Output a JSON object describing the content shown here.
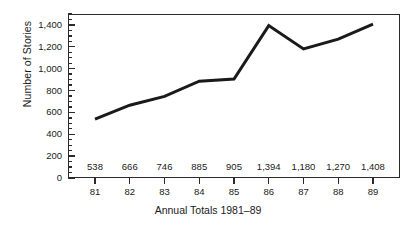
{
  "chart_data": {
    "type": "line",
    "title": "",
    "xlabel": "Annual Totals 1981–89",
    "ylabel": "Number of Stories",
    "categories": [
      "81",
      "82",
      "83",
      "84",
      "85",
      "86",
      "87",
      "88",
      "89"
    ],
    "values": [
      538,
      666,
      746,
      885,
      905,
      1394,
      1180,
      1270,
      1408
    ],
    "value_labels": [
      "538",
      "666",
      "746",
      "885",
      "905",
      "1,394",
      "1,180",
      "1,270",
      "1,408"
    ],
    "series": [
      {
        "name": "Number of Stories",
        "values": [
          538,
          666,
          746,
          885,
          905,
          1394,
          1180,
          1270,
          1408
        ]
      }
    ],
    "ylim": [
      0,
      1500
    ],
    "xlim_categories": [
      "81",
      "89"
    ],
    "y_major_ticks": [
      0,
      200,
      400,
      600,
      800,
      1000,
      1200,
      1400
    ],
    "y_tick_labels": [
      "0",
      "200",
      "400",
      "600",
      "800",
      "1,000",
      "1,200",
      "1,400"
    ],
    "y_minor_tick_step": 50,
    "grid": false,
    "legend": "none",
    "markers": false,
    "line_color": "#1a1a1a",
    "line_width_px": 3,
    "frame_color": "#2b2b2b",
    "background_color": "#ffffff"
  }
}
